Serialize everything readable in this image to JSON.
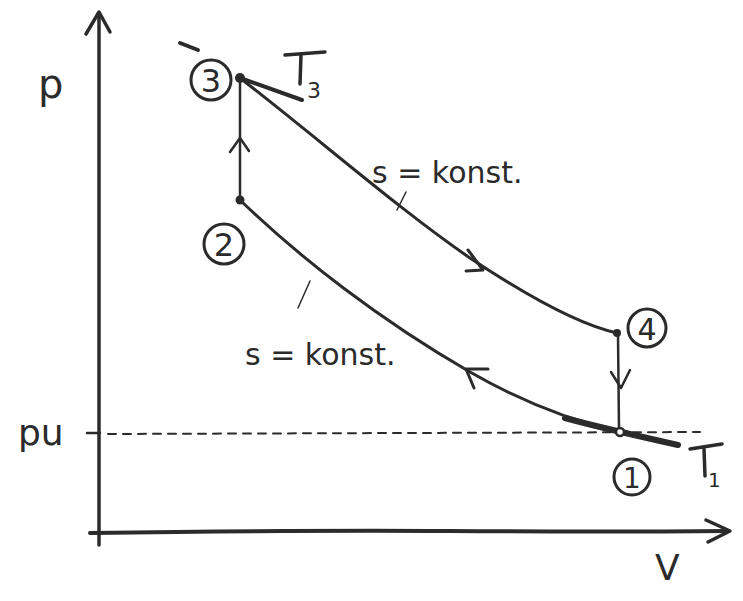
{
  "diagram": {
    "type": "p-V diagram (hand-drawn thermodynamic cycle)",
    "axes": {
      "y_label": "p",
      "x_label": "V",
      "reference_line_label": "pu"
    },
    "states": [
      {
        "id": "1",
        "label": "1"
      },
      {
        "id": "2",
        "label": "2"
      },
      {
        "id": "3",
        "label": "3"
      },
      {
        "id": "4",
        "label": "4"
      }
    ],
    "processes": [
      {
        "from": "1",
        "to": "2",
        "kind": "isentropic compression",
        "label": "s = konst."
      },
      {
        "from": "2",
        "to": "3",
        "kind": "isochoric heat addition",
        "label": ""
      },
      {
        "from": "3",
        "to": "4",
        "kind": "isentropic expansion",
        "label": "s = konst."
      },
      {
        "from": "4",
        "to": "1",
        "kind": "isochoric heat rejection",
        "label": ""
      }
    ],
    "isotherm_labels": {
      "t3_main": "T",
      "t3_sub": "3",
      "t1_main": "T",
      "t1_sub": "1"
    },
    "annotations": {
      "upper_isentrope": "s = konst.",
      "lower_isentrope": "s = konst."
    },
    "ink_color": "#2b2b2b",
    "background_color": "#ffffff"
  }
}
